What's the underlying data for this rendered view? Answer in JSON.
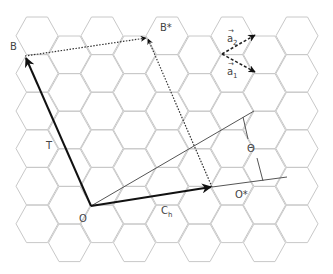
{
  "diagram": {
    "lattice": {
      "type": "honeycomb-hexagonal-grid",
      "main_columns": 5,
      "offset_columns": 4,
      "rows": 6,
      "line_color": "#c8c8c8"
    },
    "labels": {
      "B": "B",
      "B_star": "B*",
      "O": "O",
      "O_star": "O*",
      "T": "T",
      "Ch_main": "C",
      "Ch_sub": "h",
      "theta": "Θ",
      "a1_main": "a",
      "a1_sub": "1",
      "a2_main": "a",
      "a2_sub": "2",
      "vec_arrow": "→"
    },
    "vectors": [
      {
        "name": "chiral-vector",
        "label": "Ch",
        "from": "O",
        "to": "O*",
        "style": "solid-thick"
      },
      {
        "name": "translation-vector",
        "label": "T",
        "from": "O",
        "to": "B",
        "style": "solid-thick"
      },
      {
        "name": "B-to-B*",
        "from": "B",
        "to": "B*",
        "style": "dotted"
      },
      {
        "name": "O*-to-B*",
        "from": "O*",
        "to": "B*",
        "style": "dotted"
      },
      {
        "name": "a1",
        "label": "a1",
        "style": "dashed"
      },
      {
        "name": "a2",
        "label": "a2",
        "style": "dashed"
      }
    ],
    "colors": {
      "vector": "#111111",
      "guide": "#555555",
      "grid": "#c8c8c8",
      "text": "#444444"
    }
  }
}
